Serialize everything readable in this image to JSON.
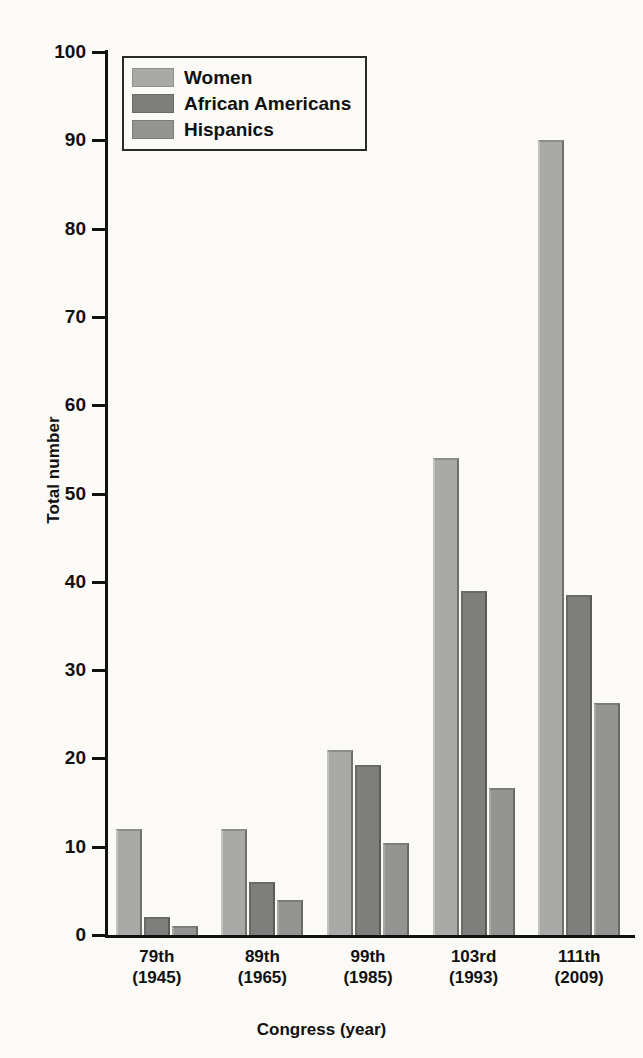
{
  "chart_data": {
    "type": "bar",
    "title": "",
    "xlabel": "Congress (year)",
    "ylabel": "Total number",
    "categories": [
      "79th\n(1945)",
      "89th\n(1965)",
      "99th\n(1985)",
      "103rd\n(1993)",
      "111th\n(2009)"
    ],
    "category_lines": [
      {
        "line1": "79th",
        "line2": "(1945)"
      },
      {
        "line1": "89th",
        "line2": "(1965)"
      },
      {
        "line1": "99th",
        "line2": "(1985)"
      },
      {
        "line1": "103rd",
        "line2": "(1993)"
      },
      {
        "line1": "111th",
        "line2": "(2009)"
      }
    ],
    "series": [
      {
        "name": "Women",
        "color": "#a9a9a7",
        "values": [
          12,
          12,
          21,
          54,
          90
        ]
      },
      {
        "name": "African Americans",
        "color": "#7e7e7c",
        "values": [
          2,
          6,
          19.3,
          39,
          38.5
        ]
      },
      {
        "name": "Hispanics",
        "color": "#949492",
        "values": [
          1,
          4,
          10.4,
          16.6,
          26.3
        ]
      }
    ],
    "ylim": [
      0,
      100
    ],
    "yticks": [
      0,
      10,
      20,
      30,
      40,
      50,
      60,
      70,
      80,
      90,
      100
    ],
    "ytick_labels": [
      "0",
      "10",
      "20",
      "30",
      "40",
      "50",
      "60",
      "70",
      "80",
      "90",
      "100"
    ],
    "grid": false,
    "legend_position": "top-left"
  },
  "legend": {
    "entries": [
      {
        "label": "Women",
        "swatch": "light-gray-swatch"
      },
      {
        "label": "African Americans",
        "swatch": "dark-gray-swatch"
      },
      {
        "label": "Hispanics",
        "swatch": "medium-gray-swatch"
      }
    ]
  },
  "colors": {
    "background": "#fbfaf7",
    "axis": "#111111",
    "women": "#a9a9a7",
    "african_americans": "#7e7e7c",
    "hispanics": "#949492"
  }
}
